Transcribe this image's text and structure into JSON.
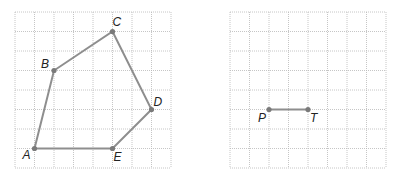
{
  "left_figure": {
    "grid": {
      "x0": 15,
      "y0": 12,
      "cols": 8,
      "rows": 8,
      "cell": 19.5
    },
    "points": [
      {
        "label": "A",
        "col": 1,
        "row": 7,
        "lx": -12,
        "ly": 10
      },
      {
        "label": "B",
        "col": 2,
        "row": 3,
        "lx": -13,
        "ly": -3
      },
      {
        "label": "C",
        "col": 5,
        "row": 1,
        "lx": 0,
        "ly": -6
      },
      {
        "label": "D",
        "col": 7,
        "row": 5,
        "lx": 2,
        "ly": -4
      },
      {
        "label": "E",
        "col": 5,
        "row": 7,
        "lx": 1,
        "ly": 12
      }
    ],
    "polygon": [
      "A",
      "B",
      "C",
      "D",
      "E"
    ]
  },
  "right_figure": {
    "grid": {
      "x0": 230,
      "y0": 12,
      "cols": 8,
      "rows": 8,
      "cell": 19.5
    },
    "points": [
      {
        "label": "P",
        "col": 2,
        "row": 5,
        "lx": -11,
        "ly": 12
      },
      {
        "label": "T",
        "col": 4,
        "row": 5,
        "lx": 2,
        "ly": 12
      }
    ],
    "segment": [
      "P",
      "T"
    ]
  },
  "colors": {
    "grid": "#b8b8b8",
    "edge": "#8e8e8e",
    "point": "#7a7a7a",
    "label": "#222222"
  }
}
